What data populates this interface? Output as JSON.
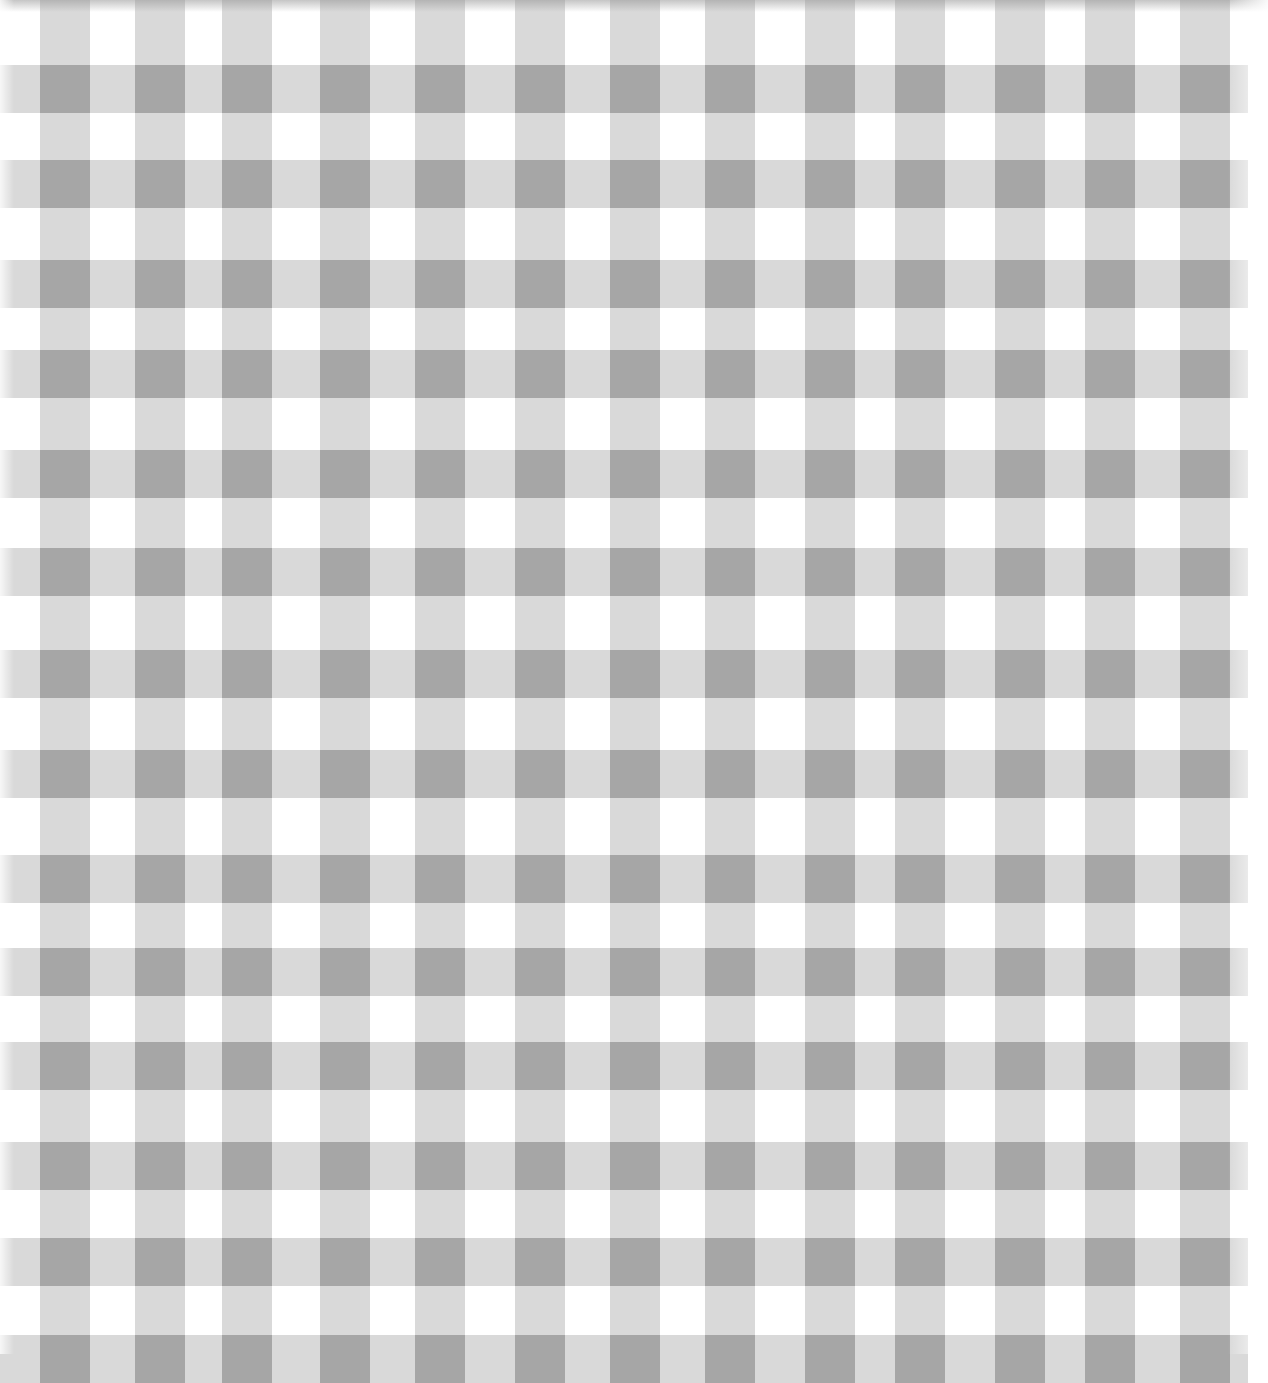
{
  "image": {
    "subject": "gray gingham check fabric pattern",
    "width": 1268,
    "height": 1354,
    "colors": {
      "background": "#ffffff",
      "stripe": "#d9d9d9",
      "crossing": "#a6a6a6"
    },
    "pattern": {
      "columns_x": [
        40,
        135,
        222,
        320,
        415,
        515,
        610,
        705,
        805,
        895,
        995,
        1085,
        1180
      ],
      "column_width": 50,
      "rows_y": [
        65,
        160,
        260,
        350,
        450,
        548,
        650,
        750,
        855,
        948,
        1042,
        1142,
        1238,
        1335
      ],
      "row_height": 48
    }
  }
}
